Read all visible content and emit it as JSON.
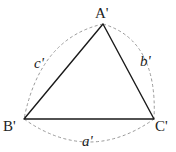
{
  "diagram": {
    "type": "triangle-with-circumscribed-arcs",
    "vertices": [
      {
        "id": "A",
        "label": "A'",
        "x": 103,
        "y": 24,
        "label_x": 101,
        "label_y": 18
      },
      {
        "id": "B",
        "label": "B'",
        "x": 24,
        "y": 119,
        "label_x": 3,
        "label_y": 131
      },
      {
        "id": "C",
        "label": "C'",
        "x": 154,
        "y": 119,
        "label_x": 155,
        "label_y": 131
      }
    ],
    "sides": [
      {
        "id": "a",
        "label": "a'",
        "from": "B",
        "to": "C",
        "label_x": 84,
        "label_y": 145
      },
      {
        "id": "b",
        "label": "b'",
        "from": "A",
        "to": "C",
        "label_x": 142,
        "label_y": 66
      },
      {
        "id": "c",
        "label": "c'",
        "from": "A",
        "to": "B",
        "label_x": 35,
        "label_y": 68
      }
    ],
    "colors": {
      "triangle": "#1a1a1a",
      "arcs": "#9a9a9a",
      "labels": "#222222"
    }
  }
}
